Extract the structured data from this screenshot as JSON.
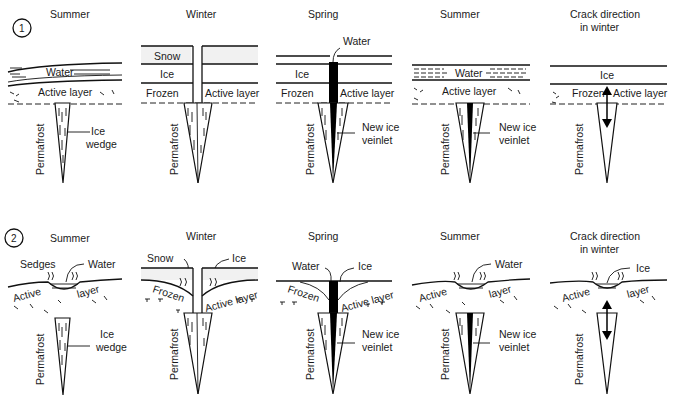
{
  "figure": {
    "rows": [
      {
        "number": "1",
        "panels": [
          {
            "title": "Summer",
            "labels": {
              "layer1": "Water",
              "layer2": "Active layer",
              "wedge": "Ice",
              "wedge2": "wedge",
              "side": "Permafrost"
            }
          },
          {
            "title": "Winter",
            "labels": {
              "layer1": "Snow",
              "layer2": "Ice",
              "left": "Frozen",
              "right": "Active layer",
              "side": "Permafrost"
            }
          },
          {
            "title": "Spring",
            "labels": {
              "top": "Water",
              "layer2": "Ice",
              "left": "Frozen",
              "right": "Active layer",
              "wedge": "New ice",
              "wedge2": "veinlet",
              "side": "Permafrost"
            }
          },
          {
            "title": "Summer",
            "labels": {
              "layer1": "Water",
              "layer2": "Active layer",
              "wedge": "New ice",
              "wedge2": "veinlet",
              "side": "Permafrost"
            }
          },
          {
            "title": "Crack direction",
            "title2": "in winter",
            "labels": {
              "layer1": "Ice",
              "left": "Frozen",
              "right": "Active layer",
              "side": "Permafrost"
            }
          }
        ]
      },
      {
        "number": "2",
        "panels": [
          {
            "title": "Summer",
            "labels": {
              "a": "Sedges",
              "b": "Water",
              "left": "Active",
              "right": "layer",
              "wedge": "Ice",
              "wedge2": "wedge",
              "side": "Permafrost"
            }
          },
          {
            "title": "Winter",
            "labels": {
              "a": "Snow",
              "b": "Ice",
              "left": "Frozen",
              "right": "Active layer",
              "side": "Permafrost"
            }
          },
          {
            "title": "Spring",
            "labels": {
              "a": "Water",
              "b": "Ice",
              "left": "Frozen",
              "right": "Active layer",
              "wedge": "New ice",
              "wedge2": "veinlet",
              "side": "Permafrost"
            }
          },
          {
            "title": "Summer",
            "labels": {
              "b": "Water",
              "left": "Active",
              "right": "layer",
              "wedge": "New ice",
              "wedge2": "veinlet",
              "side": "Permafrost"
            }
          },
          {
            "title": "Crack direction",
            "title2": "in winter",
            "labels": {
              "b": "Ice",
              "left": "Active",
              "right": "layer",
              "side": "Permafrost"
            }
          }
        ]
      }
    ],
    "colors": {
      "ink": "#111111",
      "background": "#ffffff",
      "veinlet": "#000000"
    }
  }
}
